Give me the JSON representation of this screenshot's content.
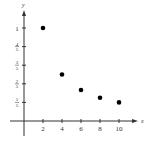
{
  "chart_data": {
    "type": "scatter",
    "title": "",
    "xlabel": "x",
    "ylabel": "y",
    "x": [
      2,
      4,
      6,
      8,
      10
    ],
    "y": [
      1,
      0.5,
      0.3333,
      0.25,
      0.2
    ],
    "xlim": [
      0,
      11
    ],
    "ylim": [
      0,
      1.1
    ],
    "x_ticks": [
      2,
      4,
      6,
      8,
      10
    ],
    "x_tick_labels": [
      "2",
      "4",
      "6",
      "8",
      "10"
    ],
    "y_ticks": [
      1,
      0.8,
      0.6,
      0.4,
      0.2
    ],
    "y_tick_labels": [
      {
        "whole": "1"
      },
      {
        "num": "4",
        "den": "5"
      },
      {
        "num": "3",
        "den": "5"
      },
      {
        "num": "2",
        "den": "5"
      },
      {
        "num": "1",
        "den": "5"
      }
    ],
    "grid": false,
    "legend": "none"
  }
}
